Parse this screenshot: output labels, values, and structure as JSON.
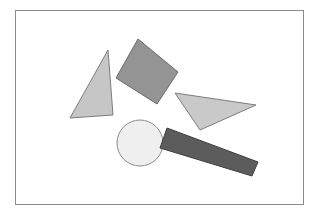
{
  "canvas": {
    "width": 319,
    "height": 215,
    "background_color": "#ffffff",
    "title": "Geometric Shapes Canvas"
  },
  "frame": {
    "name": "canvas-border-frame",
    "x": 15.5,
    "y": 10.5,
    "width": 288,
    "height": 194,
    "stroke_color": "#8a8a8a",
    "stroke_width": 1,
    "fill": "#ffffff"
  },
  "shapes": [
    {
      "id": "triangle-left",
      "label": "Light gray triangle pointing up",
      "type": "polygon",
      "points": "108,50 113,115 70,118",
      "fill": "#c6c6c6",
      "stroke": "#7d7d7d",
      "stroke_width": 1
    },
    {
      "id": "square-rotated",
      "label": "Medium gray rotated square",
      "type": "polygon",
      "points": "138,39 178,72 157,104 116,78",
      "fill": "#949494",
      "stroke": "#6b6b6b",
      "stroke_width": 1
    },
    {
      "id": "triangle-right",
      "label": "Light gray triangle pointing right",
      "type": "polygon",
      "points": "175,93 256,105 200,130",
      "fill": "#c9c9c9",
      "stroke": "#7d7d7d",
      "stroke_width": 1
    },
    {
      "id": "circle-center",
      "label": "Very light gray circle",
      "type": "circle",
      "cx": 140,
      "cy": 143,
      "r": 23,
      "fill": "#efefef",
      "stroke": "#8c8c8c",
      "stroke_width": 1
    },
    {
      "id": "rectangle-rotated",
      "label": "Dark gray elongated rectangle",
      "type": "polygon",
      "points": "167,128 258,162 252,176 160,148",
      "fill": "#5c5c5c",
      "stroke": "#3f3f3f",
      "stroke_width": 1
    }
  ],
  "palette": {
    "background": "#ffffff",
    "frame_stroke": "#8a8a8a",
    "light_gray": "#c6c6c6",
    "medium_gray": "#949494",
    "dark_gray": "#5c5c5c",
    "near_white": "#efefef"
  }
}
